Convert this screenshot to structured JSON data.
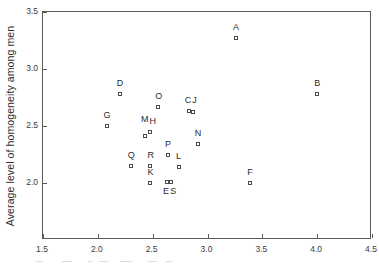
{
  "chart_data": {
    "type": "scatter",
    "title": "",
    "xlabel": "",
    "ylabel": "Average level of homogeneity among men",
    "xlim": [
      1.5,
      4.5
    ],
    "ylim": [
      1.5,
      3.5
    ],
    "xticks": [
      "1.5",
      "2.0",
      "2.5",
      "3.0",
      "3.5",
      "4.0",
      "4.5"
    ],
    "xtick_values": [
      1.5,
      2.0,
      2.5,
      3.0,
      3.5,
      4.0,
      4.5
    ],
    "yticks": [
      "2.0",
      "2.5",
      "3.0",
      "3.5"
    ],
    "ytick_values": [
      2.0,
      2.5,
      3.0,
      3.5
    ],
    "grid": false,
    "legend": "none",
    "marker_style": "open-square",
    "points": [
      {
        "label": "A",
        "x": 3.26,
        "y": 3.27,
        "label_dx": 0,
        "label_dy": -11
      },
      {
        "label": "B",
        "x": 4.0,
        "y": 2.78,
        "label_dx": 0,
        "label_dy": -11
      },
      {
        "label": "D",
        "x": 2.2,
        "y": 2.78,
        "label_dx": 0,
        "label_dy": -11
      },
      {
        "label": "O",
        "x": 2.55,
        "y": 2.67,
        "label_dx": 0,
        "label_dy": -11
      },
      {
        "label": "C",
        "x": 2.83,
        "y": 2.63,
        "label_dx": -1,
        "label_dy": -11
      },
      {
        "label": "J",
        "x": 2.87,
        "y": 2.62,
        "label_dx": 2,
        "label_dy": -12
      },
      {
        "label": "G",
        "x": 2.08,
        "y": 2.5,
        "label_dx": 0,
        "label_dy": -11
      },
      {
        "label": "M",
        "x": 2.43,
        "y": 2.41,
        "label_dx": -1,
        "label_dy": -17
      },
      {
        "label": "H",
        "x": 2.48,
        "y": 2.45,
        "label_dx": 2,
        "label_dy": -11
      },
      {
        "label": "N",
        "x": 2.91,
        "y": 2.34,
        "label_dx": 0,
        "label_dy": -11
      },
      {
        "label": "P",
        "x": 2.64,
        "y": 2.25,
        "label_dx": 0,
        "label_dy": -11
      },
      {
        "label": "Q",
        "x": 2.3,
        "y": 2.15,
        "label_dx": 0,
        "label_dy": -11
      },
      {
        "label": "L",
        "x": 2.74,
        "y": 2.14,
        "label_dx": 0,
        "label_dy": -11
      },
      {
        "label": "R",
        "x": 2.48,
        "y": 2.15,
        "label_dx": 0,
        "label_dy": -11
      },
      {
        "label": "K",
        "x": 2.48,
        "y": 2.0,
        "label_dx": 0,
        "label_dy": -11
      },
      {
        "label": "E",
        "x": 2.63,
        "y": 2.01,
        "label_dx": -1,
        "label_dy": 9
      },
      {
        "label": "S",
        "x": 2.67,
        "y": 2.01,
        "label_dx": 2,
        "label_dy": 9
      },
      {
        "label": "F",
        "x": 3.39,
        "y": 2.0,
        "label_dx": 0,
        "label_dy": -11
      }
    ]
  }
}
